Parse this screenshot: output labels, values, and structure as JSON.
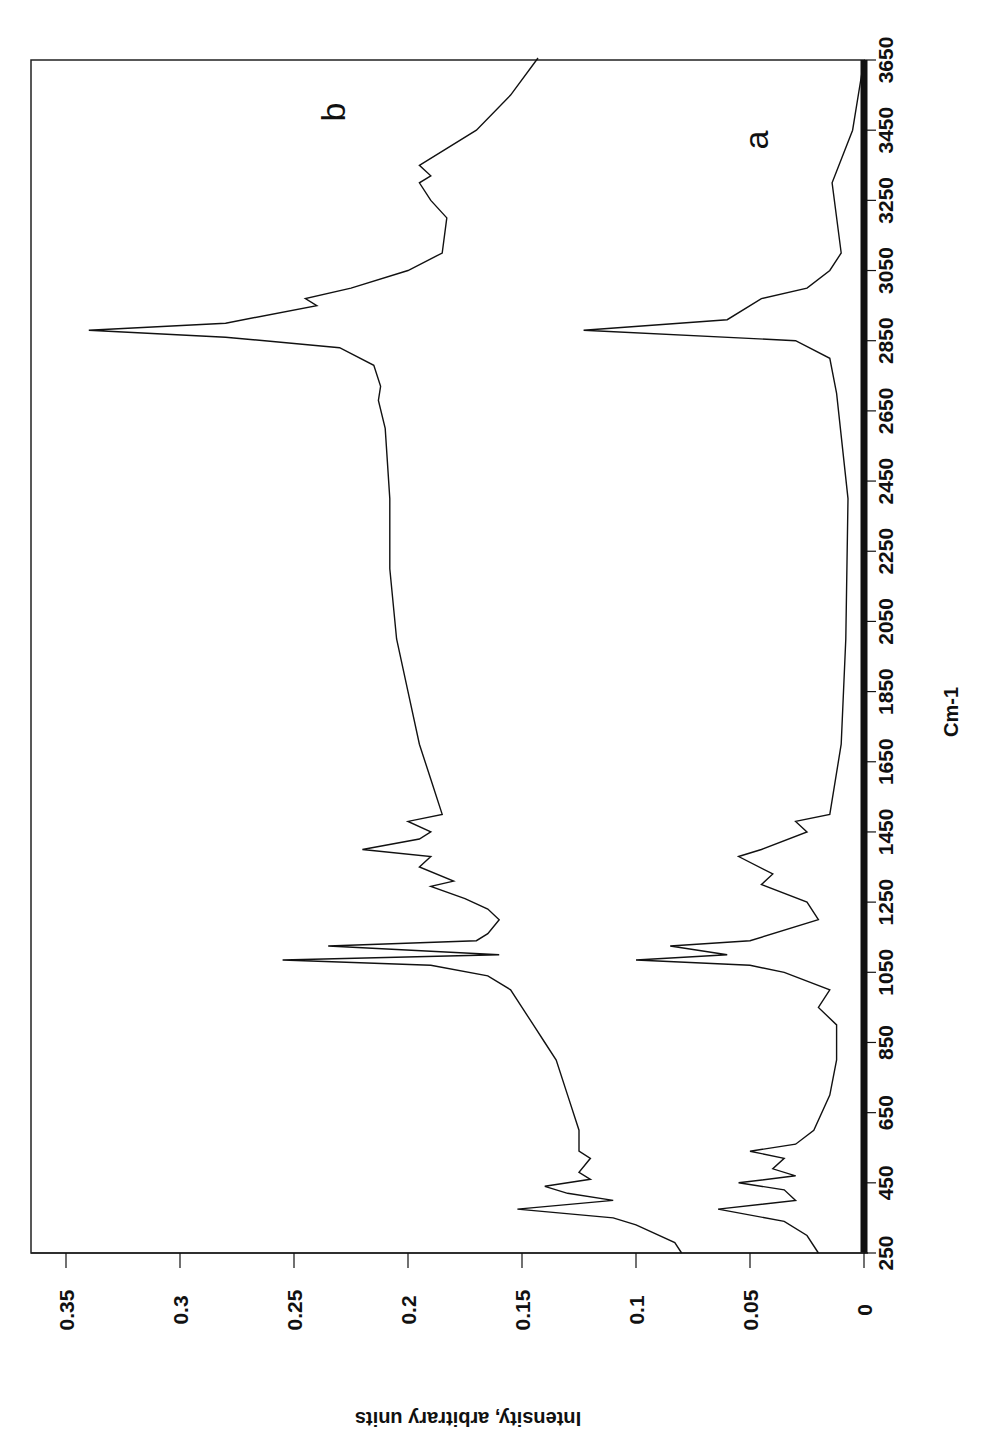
{
  "chart_data": {
    "type": "line",
    "orientation": "rotated-90",
    "title": "",
    "xlabel": "Cm-1",
    "ylabel": "Intensity, arbitrary units",
    "xlim": [
      250,
      3650
    ],
    "ylim": [
      0,
      0.35
    ],
    "x_ticks": [
      250,
      450,
      650,
      850,
      1050,
      1250,
      1450,
      1650,
      1850,
      2050,
      2250,
      2450,
      2650,
      2850,
      3050,
      3250,
      3450,
      3650
    ],
    "y_ticks": [
      "0",
      "0.05",
      "0.1",
      "0.15",
      "0.2",
      "0.25",
      "0.3",
      "0.35"
    ],
    "y_tick_values": [
      0,
      0.05,
      0.1,
      0.15,
      0.2,
      0.25,
      0.3,
      0.35
    ],
    "grid": false,
    "legend": "inline labels",
    "series": [
      {
        "name": "b",
        "x": [
          250,
          280,
          330,
          350,
          375,
          400,
          420,
          440,
          460,
          480,
          520,
          540,
          600,
          700,
          800,
          850,
          900,
          950,
          1000,
          1040,
          1070,
          1085,
          1100,
          1125,
          1140,
          1160,
          1200,
          1230,
          1260,
          1295,
          1310,
          1350,
          1380,
          1400,
          1430,
          1450,
          1480,
          1500,
          1600,
          1700,
          1850,
          2000,
          2200,
          2400,
          2600,
          2680,
          2720,
          2780,
          2830,
          2860,
          2880,
          2900,
          2950,
          2970,
          3000,
          3050,
          3100,
          3200,
          3250,
          3300,
          3320,
          3350,
          3450,
          3550,
          3700
        ],
        "values": [
          0.08,
          0.083,
          0.1,
          0.11,
          0.152,
          0.11,
          0.13,
          0.14,
          0.12,
          0.125,
          0.12,
          0.125,
          0.125,
          0.13,
          0.135,
          0.14,
          0.145,
          0.15,
          0.155,
          0.165,
          0.19,
          0.255,
          0.16,
          0.235,
          0.17,
          0.165,
          0.16,
          0.165,
          0.175,
          0.19,
          0.18,
          0.195,
          0.19,
          0.22,
          0.195,
          0.19,
          0.2,
          0.185,
          0.19,
          0.195,
          0.2,
          0.205,
          0.208,
          0.208,
          0.21,
          0.213,
          0.212,
          0.215,
          0.23,
          0.28,
          0.34,
          0.28,
          0.24,
          0.245,
          0.225,
          0.2,
          0.185,
          0.183,
          0.19,
          0.195,
          0.19,
          0.195,
          0.17,
          0.155,
          0.143
        ]
      },
      {
        "name": "a",
        "x": [
          250,
          300,
          340,
          375,
          400,
          430,
          450,
          470,
          490,
          520,
          540,
          560,
          600,
          700,
          800,
          900,
          950,
          1000,
          1050,
          1070,
          1085,
          1100,
          1125,
          1140,
          1200,
          1250,
          1300,
          1330,
          1380,
          1400,
          1450,
          1480,
          1500,
          1700,
          2000,
          2400,
          2700,
          2800,
          2850,
          2880,
          2910,
          2970,
          3000,
          3050,
          3100,
          3300,
          3450,
          3650
        ],
        "values": [
          0.02,
          0.025,
          0.035,
          0.064,
          0.03,
          0.035,
          0.055,
          0.03,
          0.04,
          0.035,
          0.05,
          0.03,
          0.022,
          0.015,
          0.012,
          0.012,
          0.02,
          0.015,
          0.035,
          0.05,
          0.1,
          0.06,
          0.085,
          0.05,
          0.02,
          0.025,
          0.045,
          0.04,
          0.055,
          0.045,
          0.025,
          0.03,
          0.015,
          0.01,
          0.008,
          0.007,
          0.012,
          0.015,
          0.03,
          0.123,
          0.06,
          0.045,
          0.025,
          0.015,
          0.01,
          0.014,
          0.005,
          0.0
        ]
      }
    ],
    "annotations": [
      {
        "text": "b",
        "series": "b"
      },
      {
        "text": "a",
        "series": "a"
      }
    ]
  }
}
